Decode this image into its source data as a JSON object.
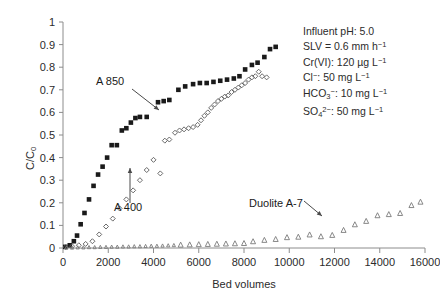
{
  "chart_data": {
    "type": "scatter",
    "title": "",
    "xlabel": "Bed volumes",
    "ylabel": "C/C0",
    "ylabel_display": "C/C₀",
    "xlim": [
      0,
      16000
    ],
    "ylim": [
      0,
      1
    ],
    "xticks": [
      0,
      2000,
      4000,
      6000,
      8000,
      10000,
      12000,
      14000,
      16000
    ],
    "xtick_labels": [
      "0",
      "2000",
      "4000",
      "6000",
      "8000",
      "10000",
      "12000",
      "14000",
      "16000"
    ],
    "yticks": [
      0,
      0.1,
      0.2,
      0.3,
      0.4,
      0.5,
      0.6,
      0.7,
      0.8,
      0.9,
      1
    ],
    "ytick_labels": [
      "0",
      "0.1",
      "0.2",
      "0.3",
      "0.4",
      "0.5",
      "0.6",
      "0.7",
      "0.8",
      "0.9",
      "1"
    ],
    "grid": false,
    "legend_position": "none",
    "series": [
      {
        "name": "A 850",
        "marker": "filled-square",
        "color": "#1a1a1a",
        "points": [
          [
            100,
            0.005
          ],
          [
            300,
            0.012
          ],
          [
            480,
            0.03
          ],
          [
            620,
            0.055
          ],
          [
            780,
            0.105
          ],
          [
            950,
            0.155
          ],
          [
            1150,
            0.215
          ],
          [
            1350,
            0.275
          ],
          [
            1550,
            0.325
          ],
          [
            1750,
            0.36
          ],
          [
            1950,
            0.4
          ],
          [
            2150,
            0.455
          ],
          [
            2380,
            0.455
          ],
          [
            2600,
            0.52
          ],
          [
            2800,
            0.53
          ],
          [
            3000,
            0.555
          ],
          [
            3200,
            0.575
          ],
          [
            3400,
            0.58
          ],
          [
            3700,
            0.58
          ],
          [
            4200,
            0.645
          ],
          [
            4450,
            0.65
          ],
          [
            4700,
            0.655
          ],
          [
            5100,
            0.7
          ],
          [
            5400,
            0.715
          ],
          [
            5750,
            0.725
          ],
          [
            6050,
            0.73
          ],
          [
            6350,
            0.73
          ],
          [
            6650,
            0.735
          ],
          [
            6950,
            0.74
          ],
          [
            7250,
            0.745
          ],
          [
            7550,
            0.75
          ],
          [
            7800,
            0.76
          ],
          [
            8050,
            0.79
          ],
          [
            8350,
            0.81
          ],
          [
            8600,
            0.82
          ],
          [
            8900,
            0.845
          ],
          [
            9150,
            0.88
          ],
          [
            9400,
            0.89
          ]
        ]
      },
      {
        "name": "A 400",
        "marker": "open-diamond",
        "color": "#5a5a5a",
        "points": [
          [
            120,
            0.004
          ],
          [
            400,
            0.008
          ],
          [
            700,
            0.012
          ],
          [
            1000,
            0.018
          ],
          [
            1300,
            0.03
          ],
          [
            1600,
            0.06
          ],
          [
            1900,
            0.095
          ],
          [
            2200,
            0.13
          ],
          [
            2500,
            0.175
          ],
          [
            2800,
            0.215
          ],
          [
            3100,
            0.255
          ],
          [
            3400,
            0.3
          ],
          [
            3700,
            0.345
          ],
          [
            4000,
            0.39
          ],
          [
            4300,
            0.33
          ],
          [
            4500,
            0.475
          ],
          [
            4700,
            0.48
          ],
          [
            4950,
            0.51
          ],
          [
            5150,
            0.52
          ],
          [
            5350,
            0.525
          ],
          [
            5550,
            0.53
          ],
          [
            5750,
            0.535
          ],
          [
            5950,
            0.545
          ],
          [
            6100,
            0.565
          ],
          [
            6250,
            0.585
          ],
          [
            6400,
            0.6
          ],
          [
            6550,
            0.62
          ],
          [
            6700,
            0.635
          ],
          [
            6850,
            0.65
          ],
          [
            7000,
            0.66
          ],
          [
            7150,
            0.67
          ],
          [
            7300,
            0.675
          ],
          [
            7450,
            0.69
          ],
          [
            7600,
            0.7
          ],
          [
            7750,
            0.71
          ],
          [
            7900,
            0.72
          ],
          [
            8050,
            0.73
          ],
          [
            8200,
            0.745
          ],
          [
            8350,
            0.755
          ],
          [
            8500,
            0.76
          ],
          [
            8650,
            0.78
          ],
          [
            8800,
            0.76
          ],
          [
            9000,
            0.755
          ]
        ]
      },
      {
        "name": "Duolite A-7",
        "marker": "open-triangle",
        "color": "#7a7a7a",
        "points": [
          [
            150,
            0.002
          ],
          [
            400,
            0.002
          ],
          [
            650,
            0.003
          ],
          [
            900,
            0.003
          ],
          [
            1150,
            0.004
          ],
          [
            1400,
            0.004
          ],
          [
            1650,
            0.005
          ],
          [
            1900,
            0.005
          ],
          [
            2150,
            0.006
          ],
          [
            2400,
            0.006
          ],
          [
            2650,
            0.007
          ],
          [
            2900,
            0.007
          ],
          [
            3150,
            0.008
          ],
          [
            3400,
            0.008
          ],
          [
            3650,
            0.009
          ],
          [
            3900,
            0.01
          ],
          [
            4150,
            0.01
          ],
          [
            4400,
            0.011
          ],
          [
            4650,
            0.012
          ],
          [
            4900,
            0.013
          ],
          [
            5200,
            0.015
          ],
          [
            5600,
            0.016
          ],
          [
            6000,
            0.017
          ],
          [
            6400,
            0.018
          ],
          [
            6800,
            0.019
          ],
          [
            7200,
            0.02
          ],
          [
            7600,
            0.021
          ],
          [
            8000,
            0.022
          ],
          [
            8400,
            0.03
          ],
          [
            8900,
            0.036
          ],
          [
            9400,
            0.04
          ],
          [
            9900,
            0.048
          ],
          [
            10400,
            0.05
          ],
          [
            10900,
            0.06
          ],
          [
            11400,
            0.052
          ],
          [
            11900,
            0.058
          ],
          [
            12400,
            0.08
          ],
          [
            12900,
            0.105
          ],
          [
            13400,
            0.12
          ],
          [
            13900,
            0.145
          ],
          [
            14400,
            0.15
          ],
          [
            14900,
            0.155
          ],
          [
            15400,
            0.19
          ],
          [
            15800,
            0.205
          ]
        ]
      }
    ],
    "annotations": [
      {
        "text": "A 850",
        "target_series": "A 850"
      },
      {
        "text": "A 400",
        "target_series": "A 400"
      },
      {
        "text": "Duolite A-7",
        "target_series": "Duolite A-7"
      }
    ],
    "conditions": [
      {
        "id": "influent-ph",
        "label": "Influent pH:",
        "value": "5.0"
      },
      {
        "id": "slv",
        "label": "SLV =",
        "value": "0.6 mm h⁻¹"
      },
      {
        "id": "cr-vi",
        "label": "Cr(VI):",
        "value": "120 µg L⁻¹"
      },
      {
        "id": "chloride",
        "label": "Cl⁻:",
        "value": "50 mg L⁻¹"
      },
      {
        "id": "bicarbonate",
        "label": "HCO₃⁻:",
        "value": "10 mg L⁻¹"
      },
      {
        "id": "sulfate",
        "label": "SO₄²⁻:",
        "value": "50 mg L⁻¹"
      }
    ]
  },
  "conditions_text": {
    "line1": "Influent pH: 5.0",
    "line2": "SLV = 0.6 mm h⁻¹",
    "line3": "Cr(VI): 120 µg L⁻¹",
    "line4": "Cl⁻: 50 mg L⁻¹",
    "line5": "HCO₃⁻: 10 mg L⁻¹",
    "line6": "SO₄²⁻: 50 mg L⁻¹"
  },
  "annotations": {
    "a850": "A 850",
    "a400": "A 400",
    "duolite": "Duolite A-7"
  },
  "axes": {
    "xlabel": "Bed volumes",
    "ylabel": "C/C₀"
  },
  "colors": {
    "series_a850": "#1a1a1a",
    "series_a400": "#5a5a5a",
    "series_duolite": "#7a7a7a",
    "axis": "#8c8c8c",
    "text": "#2b2b2b",
    "background": "#ffffff"
  }
}
